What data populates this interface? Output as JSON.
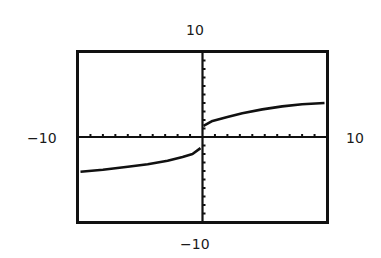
{
  "chart_data": {
    "type": "line",
    "title": "",
    "xlabel": "",
    "ylabel": "",
    "xlim": [
      -10,
      10
    ],
    "ylim": [
      -10,
      10
    ],
    "xscale_tick": 1,
    "yscale_tick": 1,
    "grid": false,
    "legend": null,
    "window_labels": {
      "xmin": "−10",
      "xmax": "10",
      "ymin": "−10",
      "ymax": "10"
    },
    "series": [
      {
        "name": "curve-left",
        "x": [
          -9.8,
          -8,
          -6,
          -4.4,
          -2.8,
          -1.6,
          -0.8,
          -0.16
        ],
        "y": [
          -4.1,
          -3.85,
          -3.5,
          -3.2,
          -2.8,
          -2.35,
          -2.0,
          -1.3
        ]
      },
      {
        "name": "curve-right",
        "x": [
          0.08,
          0.8,
          2,
          3.2,
          4.8,
          6.4,
          8,
          9.8
        ],
        "y": [
          1.3,
          1.9,
          2.35,
          2.8,
          3.25,
          3.6,
          3.85,
          4.0
        ]
      }
    ],
    "colors": {
      "axis": "#111111",
      "curve": "#111111",
      "frame": "#111111",
      "background": "#ffffff"
    }
  }
}
